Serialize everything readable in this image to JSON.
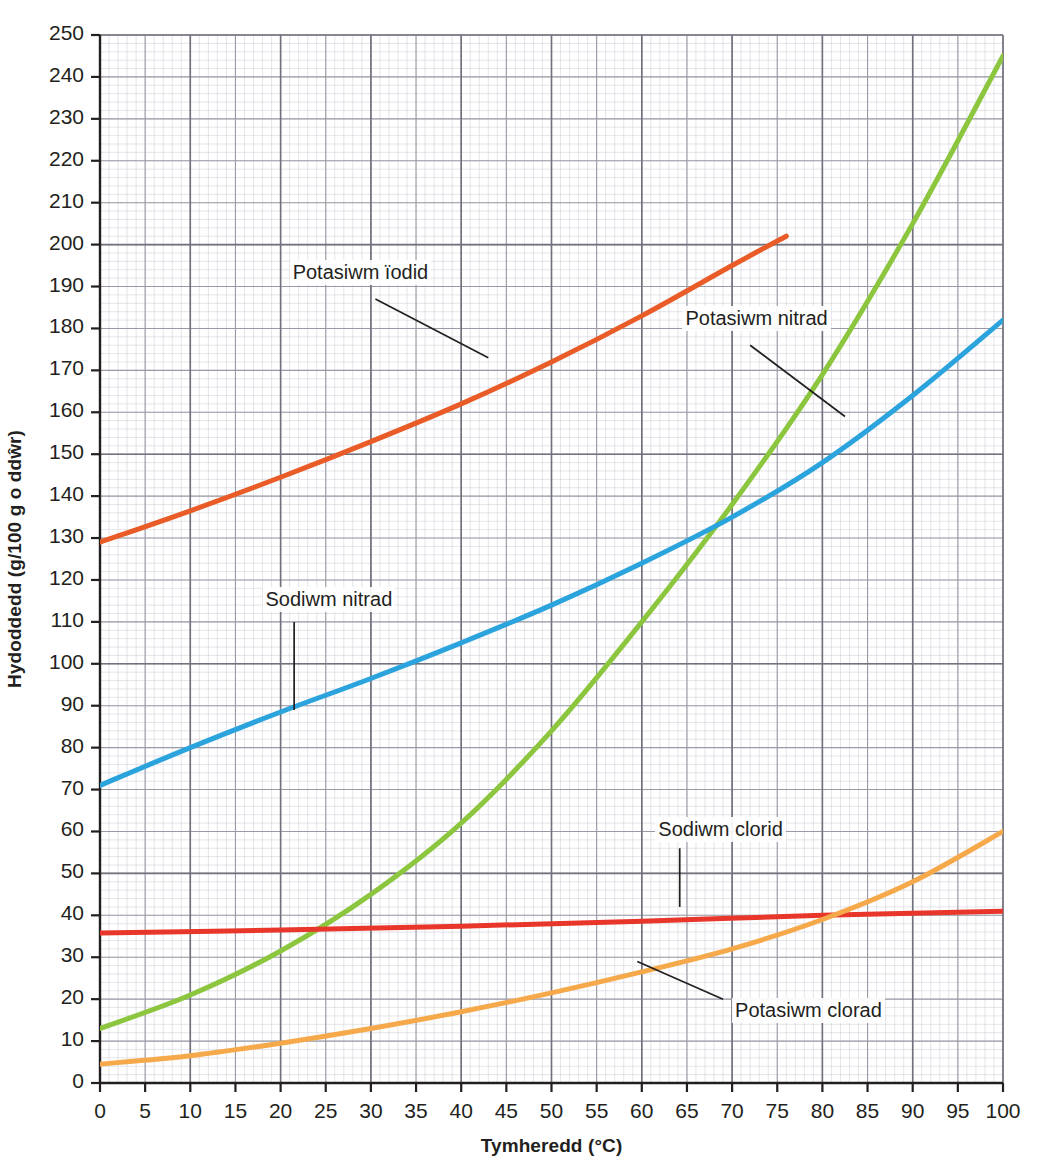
{
  "chart_data": {
    "type": "line",
    "title": "",
    "xlabel": "Tymheredd (°C)",
    "ylabel": "Hydoddedd (g/100 g o ddŵr)",
    "xlim": [
      0,
      100
    ],
    "ylim": [
      0,
      250
    ],
    "grid": true,
    "grid_style": "graph-paper",
    "x_major_step": 5,
    "y_major_step": 10,
    "legend_position": "inline-annotations",
    "xticks": [
      "0",
      "5",
      "10",
      "15",
      "20",
      "25",
      "30",
      "35",
      "40",
      "45",
      "50",
      "55",
      "60",
      "65",
      "70",
      "75",
      "80",
      "85",
      "90",
      "95",
      "100"
    ],
    "yticks": [
      "0",
      "10",
      "20",
      "30",
      "40",
      "50",
      "60",
      "70",
      "80",
      "90",
      "100",
      "110",
      "120",
      "130",
      "140",
      "150",
      "160",
      "170",
      "180",
      "190",
      "200",
      "210",
      "220",
      "230",
      "240",
      "250"
    ],
    "series": [
      {
        "name": "Potasiwm ïodid",
        "color": "#E95C28",
        "label_x": 21,
        "label_y": 193,
        "leader": [
          [
            30.5,
            187
          ],
          [
            43,
            173
          ]
        ],
        "x": [
          0,
          10,
          20,
          30,
          40,
          50,
          60,
          70,
          76
        ],
        "values": [
          129,
          136.5,
          144.5,
          153,
          162,
          172,
          183,
          195,
          202
        ],
        "clipped_at_top": true
      },
      {
        "name": "Potasiwm nitrad",
        "color": "#8CC63E",
        "label_x": 64.5,
        "label_y": 182,
        "leader": [
          [
            72,
            176
          ],
          [
            82.5,
            159
          ]
        ],
        "x": [
          0,
          10,
          20,
          30,
          40,
          50,
          60,
          70,
          80,
          90,
          100
        ],
        "values": [
          13,
          21,
          31.5,
          45,
          62,
          84,
          110,
          138,
          169,
          205,
          245
        ]
      },
      {
        "name": "Sodiwm nitrad",
        "color": "#2BA3DC",
        "label_x": 18,
        "label_y": 115,
        "leader": [
          [
            21.5,
            110
          ],
          [
            21.5,
            89
          ]
        ],
        "x": [
          0,
          10,
          20,
          30,
          40,
          50,
          60,
          70,
          80,
          90,
          100
        ],
        "values": [
          71,
          80,
          88.5,
          96.5,
          105,
          114,
          124,
          135,
          148,
          164,
          182
        ]
      },
      {
        "name": "Sodiwm clorid",
        "color": "#E8362A",
        "label_x": 61.5,
        "label_y": 60,
        "leader": [
          [
            64.2,
            56
          ],
          [
            64.2,
            42
          ]
        ],
        "x": [
          0,
          20,
          40,
          60,
          80,
          100
        ],
        "values": [
          35.8,
          36.5,
          37.4,
          38.6,
          40,
          41
        ]
      },
      {
        "name": "Potasiwm clorad",
        "color": "#F5A94B",
        "label_x": 70,
        "label_y": 17,
        "leader": [
          [
            69,
            20
          ],
          [
            59.5,
            29
          ]
        ],
        "x": [
          0,
          10,
          20,
          30,
          40,
          50,
          60,
          70,
          80,
          90,
          100
        ],
        "values": [
          4.5,
          6.5,
          9.5,
          13,
          17,
          21.5,
          26.5,
          32,
          39,
          48,
          60
        ]
      }
    ]
  },
  "axes": {
    "x_title": "Tymheredd (°C)",
    "y_title": "Hydoddedd (g/100 g o ddŵr)"
  },
  "annotations": {
    "potasiwm_iodid": "Potasiwm ïodid",
    "potasiwm_nitrad": "Potasiwm nitrad",
    "sodiwm_nitrad": "Sodiwm nitrad",
    "sodiwm_clorid": "Sodiwm clorid",
    "potasiwm_clorad": "Potasiwm clorad"
  },
  "colors": {
    "potasiwm_iodid": "#E95C28",
    "potasiwm_nitrad": "#8CC63E",
    "sodiwm_nitrad": "#2BA3DC",
    "sodiwm_clorid": "#E8362A",
    "potasiwm_clorad": "#F5A94B",
    "axis": "#231f20",
    "grid_major": "#8a8a93",
    "grid_minor": "#c9c9d2"
  }
}
